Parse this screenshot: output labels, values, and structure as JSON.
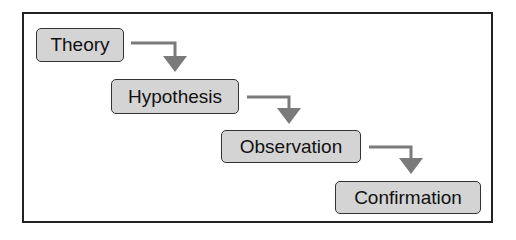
{
  "diagram": {
    "type": "staircase-flow",
    "steps": [
      {
        "label": "Theory"
      },
      {
        "label": "Hypothesis"
      },
      {
        "label": "Observation"
      },
      {
        "label": "Confirmation"
      }
    ],
    "colors": {
      "box_fill": "#d4d4d4",
      "box_border": "#333333",
      "arrow": "#7a7a7a",
      "frame": "#222222"
    }
  }
}
